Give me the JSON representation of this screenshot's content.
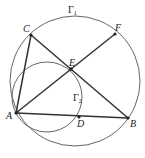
{
  "diagram": {
    "type": "geometry",
    "circles": [
      {
        "name": "Gamma1",
        "label": "Γ",
        "sub": "1",
        "cx": 75,
        "cy": 81,
        "r": 65
      },
      {
        "name": "Gamma2",
        "label": "Γ",
        "sub": "2",
        "cx": 47,
        "cy": 97,
        "r": 35
      }
    ],
    "points": {
      "A": {
        "label": "A",
        "x": 16,
        "y": 113
      },
      "B": {
        "label": "B",
        "x": 128,
        "y": 118
      },
      "C": {
        "label": "C",
        "x": 31,
        "y": 35
      },
      "D": {
        "label": "D",
        "x": 79,
        "y": 117
      },
      "E": {
        "label": "E",
        "x": 71,
        "y": 69
      },
      "F": {
        "label": "F",
        "x": 115,
        "y": 34
      }
    },
    "segments": [
      [
        "A",
        "C"
      ],
      [
        "C",
        "B"
      ],
      [
        "A",
        "B"
      ],
      [
        "A",
        "F"
      ]
    ],
    "colors": {
      "stroke": "#555555",
      "segment": "#333333",
      "point": "#222222"
    }
  }
}
